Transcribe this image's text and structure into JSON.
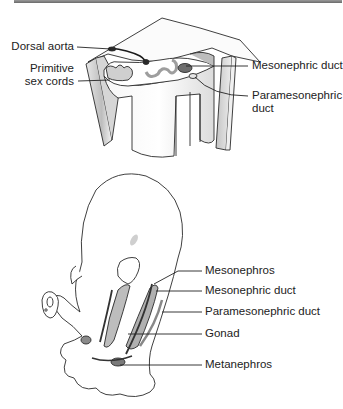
{
  "figure": {
    "top_panel": {
      "description": "Cross-section of embryonic posterior body wall",
      "labels": {
        "dorsal_aorta": "Dorsal aorta",
        "primitive_sex_cords_line1": "Primitive",
        "primitive_sex_cords_line2": "sex cords",
        "mesonephric_duct": "Mesonephric duct",
        "paramesonephric_duct_line1": "Paramesonephric",
        "paramesonephric_duct_line2": "duct"
      }
    },
    "bottom_panel": {
      "description": "Embryo with urogenital ridge structures",
      "labels": {
        "mesonephros": "Mesonephros",
        "mesonephric_duct": "Mesonephric duct",
        "paramesonephric_duct": "Paramesonephric duct",
        "gonad": "Gonad",
        "metanephros": "Metanephros"
      }
    },
    "colors": {
      "outline": "#2a2a2a",
      "light_fill": "#f2f2f2",
      "mid_fill": "#c8c8c8",
      "dark_fill": "#6e6e6e",
      "leader_line": "#222222"
    }
  }
}
